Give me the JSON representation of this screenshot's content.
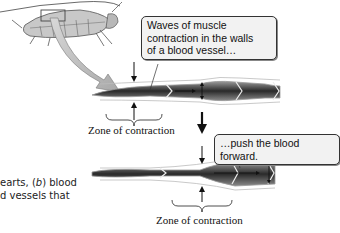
{
  "figure": {
    "callout_top": {
      "line1": "Waves of muscle",
      "line2": "contraction in the walls",
      "line3": "of a blood vessel…"
    },
    "callout_bottom": {
      "text": "…push the blood forward."
    },
    "zone_label_top": "Zone of contraction",
    "zone_label_bottom": "Zone of contraction",
    "caption_fragment": {
      "line1_prefix": "earts, (",
      "line1_italic": "b",
      "line1_suffix": ") blood",
      "line2": "d vessels that"
    },
    "colors": {
      "vessel_dark": "#2a2a2a",
      "vessel_mid": "#6e6e6e",
      "vessel_wall": "#d9d9d9",
      "arrow_fill": "#bdbdbd",
      "callout_bg": "#f2f2f2"
    }
  }
}
